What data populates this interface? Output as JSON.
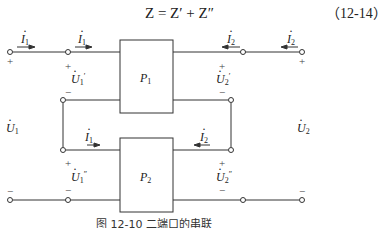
{
  "equation": {
    "text": "Z = Z′ + Z″",
    "number": "（12-14）"
  },
  "diagram": {
    "blocks": [
      {
        "id": "P1",
        "name": "P",
        "sub": "1"
      },
      {
        "id": "P2",
        "name": "P",
        "sub": "2"
      }
    ],
    "currents": {
      "i1_outer": {
        "sym": "I",
        "sub": "1"
      },
      "i1_inner_top": {
        "sym": "I",
        "sub": "1"
      },
      "i1_inner_bottom": {
        "sym": "I",
        "sub": "1"
      },
      "i2_outer": {
        "sym": "I",
        "sub": "2"
      },
      "i2_inner_top": {
        "sym": "I",
        "sub": "2"
      },
      "i2_inner_bottom": {
        "sym": "I",
        "sub": "2"
      }
    },
    "voltages": {
      "u1": {
        "sym": "U",
        "sub": "1",
        "sup": ""
      },
      "u1_prime": {
        "sym": "U",
        "sub": "1",
        "sup": "′"
      },
      "u1_dprime": {
        "sym": "U",
        "sub": "1",
        "sup": "″"
      },
      "u2": {
        "sym": "U",
        "sub": "2",
        "sup": ""
      },
      "u2_prime": {
        "sym": "U",
        "sub": "2",
        "sup": "′"
      },
      "u2_dprime": {
        "sym": "U",
        "sub": "2",
        "sup": "″"
      }
    },
    "signs": {
      "plus": "+",
      "minus": "−"
    }
  },
  "caption": "图 12-10   二端口的串联"
}
